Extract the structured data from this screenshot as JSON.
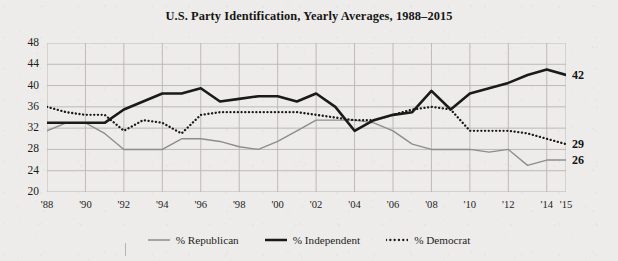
{
  "chart_data": {
    "type": "line",
    "title": "U.S. Party Identification, Yearly Averages, 1988–2015",
    "xlabel": "",
    "ylabel": "",
    "ylim": [
      20,
      48
    ],
    "yticks": [
      20,
      24,
      28,
      32,
      36,
      40,
      44,
      48
    ],
    "xlim": [
      1988,
      2015
    ],
    "xticks": [
      1988,
      1990,
      1992,
      1994,
      1996,
      1998,
      2000,
      2002,
      2004,
      2006,
      2008,
      2010,
      2012,
      2014,
      2015
    ],
    "xticklabels": [
      "'88",
      "'90",
      "'92",
      "'94",
      "'96",
      "'98",
      "'00",
      "'02",
      "'04",
      "'06",
      "'08",
      "'10",
      "'12",
      "'14",
      "'15"
    ],
    "grid": true,
    "legend_position": "bottom",
    "x": [
      1988,
      1989,
      1990,
      1991,
      1992,
      1993,
      1994,
      1995,
      1996,
      1997,
      1998,
      1999,
      2000,
      2001,
      2002,
      2003,
      2004,
      2005,
      2006,
      2007,
      2008,
      2009,
      2010,
      2011,
      2012,
      2013,
      2014,
      2015
    ],
    "series": [
      {
        "name": "% Republican",
        "color": "#8d8d8d",
        "style": "solid-thin",
        "end_label": "26",
        "values": [
          31.5,
          33.0,
          33.0,
          31.0,
          28.0,
          28.0,
          28.0,
          30.0,
          30.0,
          29.5,
          28.5,
          28.0,
          29.5,
          31.5,
          33.5,
          33.5,
          33.5,
          33.0,
          31.5,
          29.0,
          28.0,
          28.0,
          28.0,
          27.5,
          28.0,
          25.0,
          26.0,
          26.0
        ]
      },
      {
        "name": "% Independent",
        "color": "#1a1a1a",
        "style": "solid-thick",
        "end_label": "42",
        "values": [
          33.0,
          33.0,
          33.0,
          33.0,
          35.5,
          37.0,
          38.5,
          38.5,
          39.5,
          37.0,
          37.5,
          38.0,
          38.0,
          37.0,
          38.5,
          36.0,
          31.5,
          33.5,
          34.5,
          35.0,
          39.0,
          35.5,
          38.5,
          39.5,
          40.5,
          42.0,
          43.0,
          42.0
        ]
      },
      {
        "name": "% Democrat",
        "color": "#1a1a1a",
        "style": "dotted",
        "end_label": "29",
        "values": [
          36.0,
          35.0,
          34.5,
          34.5,
          31.5,
          33.5,
          33.0,
          31.0,
          34.5,
          35.0,
          35.0,
          35.0,
          35.0,
          35.0,
          34.5,
          34.0,
          33.5,
          33.5,
          34.5,
          35.5,
          36.0,
          35.5,
          31.5,
          31.5,
          31.5,
          31.0,
          30.0,
          29.0
        ]
      }
    ]
  },
  "legend": {
    "items": [
      {
        "label": "% Republican"
      },
      {
        "label": "% Independent"
      },
      {
        "label": "% Democrat"
      }
    ]
  }
}
